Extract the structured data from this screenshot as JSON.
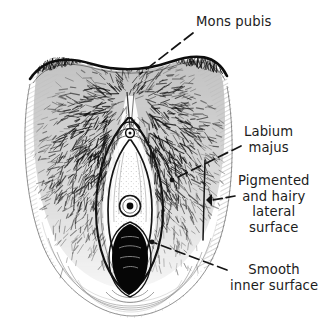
{
  "figure": {
    "medium": "pen-and-ink line drawing",
    "background_color": "#ffffff",
    "ink_color": "#111111",
    "text_color": "#1c1c1c",
    "width": 319,
    "height": 332
  },
  "labels": [
    {
      "id": "mons-pubis",
      "text": "Mons pubis",
      "lines": [
        "Mons pubis"
      ],
      "align": "left",
      "x": 196,
      "y": 14,
      "leader": {
        "style": "dashed",
        "from_x": 193,
        "from_y": 33,
        "to_x": 140,
        "to_y": 74,
        "terminus": "none"
      }
    },
    {
      "id": "labium-majus",
      "text": "Labium majus",
      "lines": [
        "Labium",
        "majus"
      ],
      "align": "center",
      "x": 244,
      "y": 124,
      "leader": {
        "style": "dashed",
        "from_x": 241,
        "from_y": 146,
        "to_x": 172,
        "to_y": 180,
        "terminus": "dot"
      }
    },
    {
      "id": "pigmented-lateral-surface",
      "text": "Pigmented and hairy lateral surface",
      "lines": [
        "Pigmented",
        "and hairy",
        "lateral",
        "surface"
      ],
      "align": "center",
      "x": 238,
      "y": 173,
      "leader": {
        "style": "dashed",
        "from_x": 235,
        "from_y": 196,
        "to_x": 209,
        "to_y": 201,
        "terminus": "bracket"
      }
    },
    {
      "id": "smooth-inner-surface",
      "text": "Smooth inner surface",
      "lines": [
        "Smooth",
        "inner surface"
      ],
      "align": "center",
      "x": 230,
      "y": 262,
      "leader": {
        "style": "dashed",
        "from_x": 227,
        "from_y": 270,
        "to_x": 152,
        "to_y": 243,
        "terminus": "dot"
      }
    }
  ]
}
